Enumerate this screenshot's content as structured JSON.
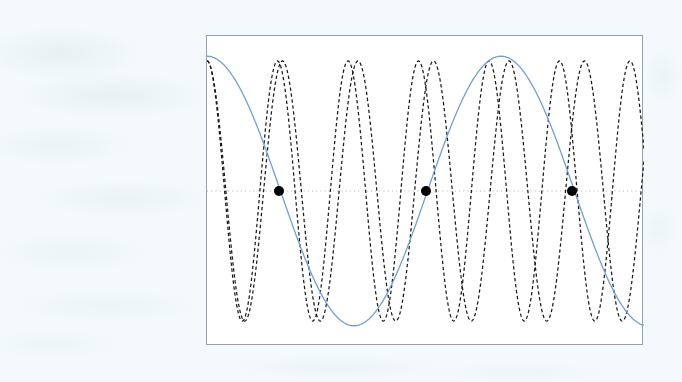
{
  "figure": {
    "background_color": "#ffffff",
    "page_background_color": "#f4fafc",
    "border_color": "#8fa3b0",
    "title": "",
    "xlabel": "",
    "ylabel": "",
    "axis_ticks_visible": false,
    "axis_labels_visible": false,
    "legend_visible": false
  },
  "chart_data": {
    "type": "line",
    "title": "",
    "subtitle": "",
    "xlabel": "",
    "ylabel": "",
    "xlim": [
      0,
      437
    ],
    "ylim": [
      -1.15,
      1.15
    ],
    "grid": false,
    "legend": null,
    "legend_position": "none",
    "axis_tick_labels": {
      "x": [],
      "y": []
    },
    "annotations": [],
    "zero_line": {
      "name": "zero-reference-line",
      "y_value": 0,
      "style": "dotted",
      "color": "#b9a8a8",
      "width": 0.8
    },
    "series": [
      {
        "name": "envelope-carrier",
        "label": "",
        "color": "#6f9fd8",
        "style": "solid",
        "width": 1.3,
        "waveform": "cosine",
        "amplitude": 1.0,
        "period_px": 294,
        "phase_deg": 0,
        "zero_crossings_px": [
          72,
          219,
          365
        ]
      },
      {
        "name": "modulated-wave-a",
        "label": "",
        "color": "#1a1a1a",
        "style": "dashed",
        "width": 1.25,
        "waveform": "cosine",
        "amplitude": 0.965,
        "period_px": 70.5,
        "phase_deg": 0
      },
      {
        "name": "modulated-wave-b",
        "label": "",
        "color": "#1a1a1a",
        "style": "dashed",
        "width": 1.25,
        "waveform": "cosine",
        "amplitude": 0.965,
        "period_px": 75.5,
        "phase_deg": 0
      }
    ],
    "markers": [
      {
        "name": "intersection-marker-1",
        "x_px": 72,
        "y_value": 0,
        "shape": "circle",
        "color": "#000000",
        "radius_px": 5
      },
      {
        "name": "intersection-marker-2",
        "x_px": 219,
        "y_value": 0,
        "shape": "circle",
        "color": "#000000",
        "radius_px": 5
      },
      {
        "name": "intersection-marker-3",
        "x_px": 365,
        "y_value": 0,
        "shape": "circle",
        "color": "#000000",
        "radius_px": 5
      }
    ]
  }
}
